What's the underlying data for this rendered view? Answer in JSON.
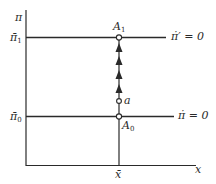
{
  "diagram": {
    "axes": {
      "y_label": "π",
      "x_label": "x"
    },
    "levels": [
      {
        "id": "pi_bar_1",
        "label": "π̄",
        "subscript": "1",
        "curve_label": "π̇′ = 0"
      },
      {
        "id": "pi_bar_0",
        "label": "π̄",
        "subscript": "0",
        "curve_label": "π̇ = 0"
      }
    ],
    "x_tick": {
      "label": "x̄"
    },
    "points": [
      {
        "id": "A1",
        "label": "A",
        "subscript": "1"
      },
      {
        "id": "a",
        "label": "a"
      },
      {
        "id": "A0",
        "label": "A",
        "subscript": "0"
      }
    ],
    "arrows": {
      "count": 4,
      "direction": "up"
    },
    "colors": {
      "line": "#2a2a2a",
      "background": "#ffffff"
    }
  }
}
